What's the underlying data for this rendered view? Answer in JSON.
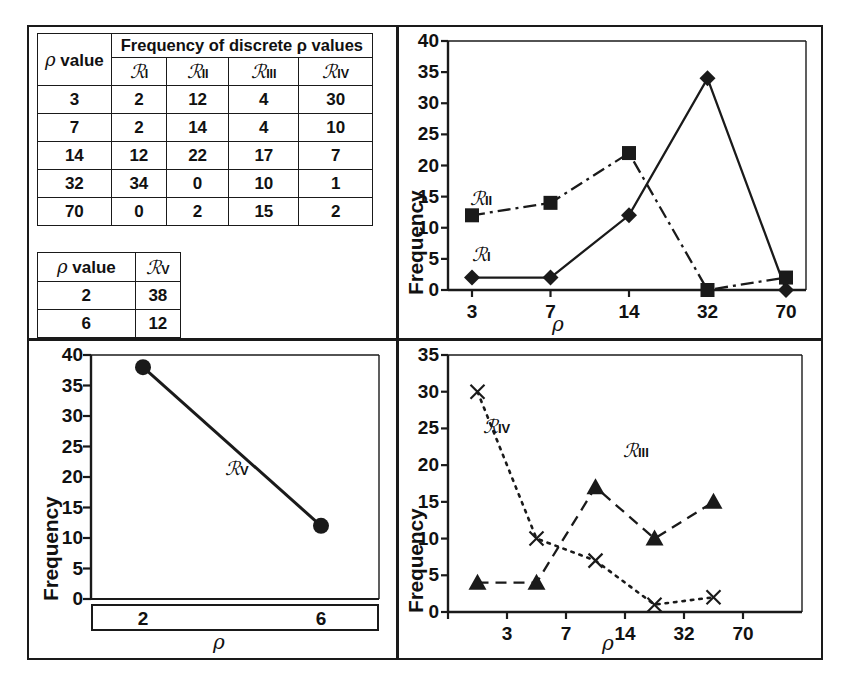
{
  "figure": {
    "rho_symbol": "ρ",
    "script_r": "ℛ"
  },
  "table_main": {
    "name": "frequency-of-discrete-rho-values",
    "header_span": "Frequency of discrete ρ values",
    "header_rho": "ρ value",
    "columns": [
      "I",
      "II",
      "III",
      "IV"
    ],
    "rows": [
      {
        "rho": "3",
        "values": [
          "2",
          "12",
          "4",
          "30"
        ]
      },
      {
        "rho": "7",
        "values": [
          "2",
          "14",
          "4",
          "10"
        ]
      },
      {
        "rho": "14",
        "values": [
          "12",
          "22",
          "17",
          "7"
        ]
      },
      {
        "rho": "32",
        "values": [
          "34",
          "0",
          "10",
          "1"
        ]
      },
      {
        "rho": "70",
        "values": [
          "0",
          "2",
          "15",
          "2"
        ]
      }
    ]
  },
  "table_v": {
    "name": "frequency-table-rv",
    "header_rho": "ρ value",
    "column": "V",
    "rows": [
      {
        "rho": "2",
        "value": "38"
      },
      {
        "rho": "6",
        "value": "12"
      }
    ]
  },
  "chart_data": [
    {
      "id": "chart-top-right",
      "type": "line",
      "title": "",
      "xlabel": "ρ",
      "ylabel": "Frequency",
      "categories": [
        "3",
        "7",
        "14",
        "32",
        "70"
      ],
      "ylim": [
        0,
        40
      ],
      "yticks": [
        "0",
        "5",
        "10",
        "15",
        "20",
        "25",
        "30",
        "35",
        "40"
      ],
      "grid": false,
      "legend": "inline-annotations",
      "series": [
        {
          "name": "ℛ I",
          "label_sub": "I",
          "marker": "diamond",
          "line": "solid",
          "values": [
            2,
            2,
            12,
            34,
            0
          ]
        },
        {
          "name": "ℛ II",
          "label_sub": "II",
          "marker": "square",
          "line": "dash-dot",
          "values": [
            12,
            14,
            22,
            0,
            2
          ]
        }
      ]
    },
    {
      "id": "chart-bottom-left",
      "type": "line",
      "title": "",
      "xlabel": "ρ",
      "ylabel": "Frequency",
      "categories": [
        "2",
        "6"
      ],
      "ylim": [
        0,
        40
      ],
      "yticks": [
        "0",
        "5",
        "10",
        "15",
        "20",
        "25",
        "30",
        "35",
        "40"
      ],
      "grid": false,
      "legend": "inline-annotations",
      "series": [
        {
          "name": "ℛ V",
          "label_sub": "V",
          "marker": "circle",
          "line": "solid",
          "values": [
            38,
            12
          ]
        }
      ]
    },
    {
      "id": "chart-bottom-right",
      "type": "line",
      "title": "",
      "xlabel": "ρ",
      "ylabel": "Frequency",
      "categories": [
        "3",
        "7",
        "14",
        "32",
        "70"
      ],
      "ylim": [
        0,
        35
      ],
      "yticks": [
        "0",
        "5",
        "10",
        "15",
        "20",
        "25",
        "30",
        "35"
      ],
      "grid": false,
      "legend": "inline-annotations",
      "series": [
        {
          "name": "ℛ III",
          "label_sub": "III",
          "marker": "triangle",
          "line": "dashed",
          "values": [
            4,
            4,
            17,
            10,
            15
          ]
        },
        {
          "name": "ℛ IV",
          "label_sub": "IV",
          "marker": "cross",
          "line": "dotted",
          "values": [
            30,
            10,
            7,
            1,
            2
          ]
        }
      ]
    }
  ],
  "colors": {
    "ink": "#1a1a1a",
    "background": "#ffffff"
  }
}
